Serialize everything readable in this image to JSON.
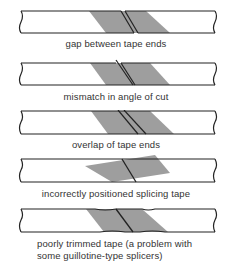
{
  "colors": {
    "tape_outline": "#222222",
    "splice_fill": "#9e9e9e",
    "background": "#ffffff",
    "text": "#333333"
  },
  "diagrams": [
    {
      "id": "gap",
      "caption": "gap between tape ends"
    },
    {
      "id": "mismatch",
      "caption": "mismatch in angle of cut"
    },
    {
      "id": "overlap",
      "caption": "overlap of tape ends"
    },
    {
      "id": "incorrect-position",
      "caption": "incorrectly positioned splicing tape"
    },
    {
      "id": "poorly-trimmed",
      "caption_lines": [
        "poorly trimmed tape (a problem with",
        "some guillotine-type splicers)"
      ]
    }
  ]
}
